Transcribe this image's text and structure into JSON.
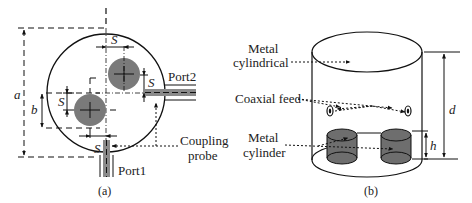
{
  "panel_a": {
    "caption": "(a)",
    "labels": {
      "a": "a",
      "b": "b",
      "s_top": "S",
      "s_right": "S",
      "s_left": "S",
      "s_bottom": "S",
      "port1": "Port1",
      "port2": "Port2",
      "coupling_line1": "Coupling",
      "coupling_line2": "probe"
    },
    "colors": {
      "disk": "#7a7a7a",
      "port_fill": "#8a8a8a",
      "stroke": "#111111"
    }
  },
  "panel_b": {
    "caption": "(b)",
    "labels": {
      "metal_cyl_line1": "Metal",
      "metal_cyl_line2": "cylindrical",
      "coaxial_feed": "Coaxial feed",
      "metal_cylinder_line1": "Metal",
      "metal_cylinder_line2": "cylinder",
      "d": "d",
      "h": "h"
    },
    "colors": {
      "cylinder_fill": "#6e6e6e",
      "stroke": "#111111"
    }
  }
}
